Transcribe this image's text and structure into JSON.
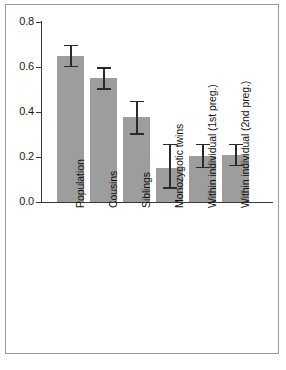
{
  "chart_data": {
    "type": "bar",
    "title": "",
    "subtitle": "",
    "xlabel": "",
    "ylabel": "",
    "ylim": [
      0.0,
      0.8
    ],
    "ytick_labels": [
      "0.0",
      "0.2",
      "0.4",
      "0.6",
      "0.8"
    ],
    "ytick_values": [
      0.0,
      0.2,
      0.4,
      0.6,
      0.8
    ],
    "grid": false,
    "legend": null,
    "legend_position": "none",
    "orientation": "vertical",
    "error_bars": "symmetric caps",
    "categories": [
      "Population",
      "Cousins",
      "Siblings",
      "Monozygotic twins",
      "Within individual (1st preg.)",
      "Within individual (2nd preg.)"
    ],
    "values": [
      0.65,
      0.55,
      0.38,
      0.15,
      0.205,
      0.21
    ],
    "error_low": [
      0.6,
      0.5,
      0.3,
      0.06,
      0.15,
      0.16
    ],
    "error_high": [
      0.7,
      0.6,
      0.45,
      0.26,
      0.26,
      0.26
    ],
    "bar_color": "#9d9d9d",
    "errorbar_color": "#2b2b2b",
    "axis_color": "#3a3a3a",
    "frame_color": "#9a9a9a",
    "background_color": "#ffffff"
  }
}
